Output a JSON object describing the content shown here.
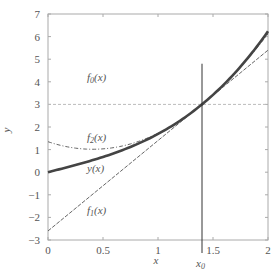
{
  "chart_data": {
    "type": "line",
    "title": "",
    "xlabel": "x",
    "ylabel": "y",
    "xlim": [
      0,
      2
    ],
    "ylim": [
      -3,
      7
    ],
    "x_ticks": [
      "0",
      "0.5",
      "1",
      "1.5",
      "2"
    ],
    "y_ticks": [
      "-3",
      "-2",
      "-1",
      "0",
      "1",
      "2",
      "3",
      "4",
      "5",
      "6",
      "7"
    ],
    "grid": false,
    "legend": "none (inline curve labels)",
    "annotations": [
      {
        "text": "x0",
        "x": 1.4,
        "note": "vertical line marking expansion point"
      },
      {
        "text": "f0(x)",
        "x": 0.45,
        "y": 3.4
      },
      {
        "text": "f2(x)",
        "x": 0.45,
        "y": 1.5
      },
      {
        "text": "y(x)",
        "x": 0.45,
        "y": 0.35
      },
      {
        "text": "f1(x)",
        "x": 0.45,
        "y": -1.6
      }
    ],
    "x0": 1.4,
    "series": [
      {
        "name": "y(x)",
        "style": "thick solid",
        "x": [
          0,
          0.25,
          0.5,
          0.75,
          1.0,
          1.25,
          1.4,
          1.6,
          1.8,
          2.0
        ],
        "values": [
          0.0,
          0.32,
          0.67,
          1.07,
          1.69,
          2.45,
          3.0,
          3.87,
          4.91,
          6.23
        ]
      },
      {
        "name": "f0(x)",
        "style": "light dashed",
        "x": [
          0,
          2
        ],
        "values": [
          3.0,
          3.0
        ]
      },
      {
        "name": "f1(x)",
        "style": "thin dashed",
        "x": [
          0,
          2
        ],
        "values": [
          -2.6,
          5.4
        ]
      },
      {
        "name": "f2(x)",
        "style": "dash-dot",
        "x": [
          0,
          0.25,
          0.5,
          0.75,
          1.0,
          1.25,
          1.4,
          1.6,
          1.8,
          2.0
        ],
        "values": [
          1.35,
          1.13,
          1.05,
          1.1,
          1.32,
          2.45,
          3.0,
          3.88,
          4.92,
          6.13
        ]
      }
    ]
  },
  "labels": {
    "f0": "f",
    "f0_sub": "0",
    "f1": "f",
    "f1_sub": "1",
    "f2": "f",
    "f2_sub": "2",
    "fx": "(x)",
    "y": "y(x)",
    "xlabel": "x",
    "ylabel": "y",
    "x0": "x",
    "x0_sub": "0"
  }
}
